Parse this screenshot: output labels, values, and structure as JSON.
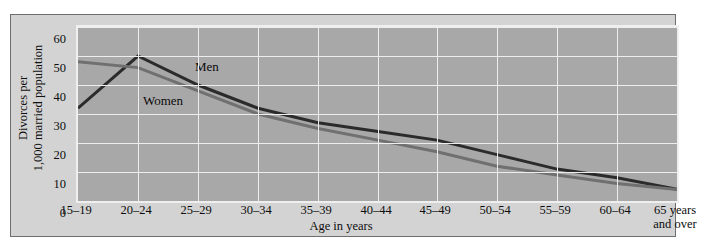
{
  "chart_data": {
    "type": "line",
    "title": "",
    "xlabel": "Age in years",
    "ylabel": "Divorces per\n1,000 married population",
    "categories": [
      "15–19",
      "20–24",
      "25–29",
      "30–34",
      "35–39",
      "40–44",
      "45–49",
      "50–54",
      "55–59",
      "60–64",
      "65 years\nand over"
    ],
    "ylim": [
      0,
      60
    ],
    "yticks": [
      0,
      10,
      20,
      30,
      40,
      50,
      60
    ],
    "grid": true,
    "legend_position": "inline-annotation",
    "series": [
      {
        "name": "Men",
        "color": "#2b2b2b",
        "values": [
          32,
          50,
          40,
          32,
          27,
          24,
          21,
          16,
          11,
          8,
          4
        ]
      },
      {
        "name": "Women",
        "color": "#707070",
        "values": [
          48,
          46,
          38,
          30,
          25,
          21,
          17,
          12,
          9,
          6,
          4
        ]
      }
    ],
    "annotations": [
      {
        "text": "Men",
        "x_px": 193,
        "y_px": 57
      },
      {
        "text": "Women",
        "x_px": 141,
        "y_px": 91
      }
    ]
  },
  "axes": {
    "y_tick_labels": [
      "60",
      "50",
      "40",
      "30",
      "20",
      "10",
      "0"
    ],
    "y_title_line1": "Divorces per",
    "y_title_line2": "1,000 married population",
    "x_title": "Age in years",
    "x_tick_labels": [
      "15–19",
      "20–24",
      "25–29",
      "30–34",
      "35–39",
      "40–44",
      "45–49",
      "50–54",
      "55–59",
      "60–64",
      "65 years\nand over"
    ]
  },
  "colors": {
    "panel_background": "#d3d3d3",
    "plot_background": "#a8a8a8",
    "gridline": "#ededed",
    "men_line": "#2b2b2b",
    "women_line": "#707070",
    "frame_border": "#6e6e6e",
    "text": "#101010"
  }
}
